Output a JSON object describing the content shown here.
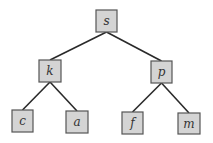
{
  "diagram": {
    "type": "binary-tree",
    "colors": {
      "node_fill": "#d4d4d4",
      "node_stroke": "#555555",
      "edge": "#2a2a2a",
      "label": "#333333"
    },
    "nodes": [
      {
        "id": "s",
        "label": "s",
        "x": 96,
        "y": 10,
        "w": 21,
        "h": 22
      },
      {
        "id": "k",
        "label": "k",
        "x": 39,
        "y": 60,
        "w": 22,
        "h": 22
      },
      {
        "id": "p",
        "label": "p",
        "x": 151,
        "y": 61,
        "w": 21,
        "h": 22
      },
      {
        "id": "c",
        "label": "c",
        "x": 12,
        "y": 110,
        "w": 21,
        "h": 22
      },
      {
        "id": "a",
        "label": "a",
        "x": 66,
        "y": 111,
        "w": 22,
        "h": 22
      },
      {
        "id": "f",
        "label": "f",
        "x": 122,
        "y": 112,
        "w": 21,
        "h": 22
      },
      {
        "id": "m",
        "label": "m",
        "x": 178,
        "y": 113,
        "w": 22,
        "h": 21
      }
    ],
    "edges": [
      {
        "from": "s",
        "to": "k"
      },
      {
        "from": "s",
        "to": "p"
      },
      {
        "from": "k",
        "to": "c"
      },
      {
        "from": "k",
        "to": "a"
      },
      {
        "from": "p",
        "to": "f"
      },
      {
        "from": "p",
        "to": "m"
      }
    ]
  }
}
